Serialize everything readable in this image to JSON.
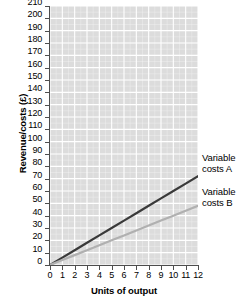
{
  "chart_data": {
    "type": "line",
    "title": "",
    "xlabel": "Units of output",
    "ylabel": "Revenue/costs (£)",
    "xlim": [
      0,
      12
    ],
    "ylim": [
      0,
      210
    ],
    "grid": true,
    "grid_minor": true,
    "legend_position": "inline-right",
    "x_ticks": [
      0,
      1,
      2,
      3,
      4,
      5,
      6,
      7,
      8,
      9,
      10,
      11,
      12
    ],
    "x_ticklabels": [
      "0",
      "1",
      "2",
      "3",
      "4",
      "5",
      "6",
      "7",
      "8",
      "9",
      "10",
      "11",
      "12"
    ],
    "y_ticks": [
      0,
      10,
      20,
      30,
      40,
      50,
      60,
      70,
      80,
      90,
      100,
      110,
      120,
      130,
      140,
      150,
      160,
      170,
      180,
      190,
      200,
      210
    ],
    "y_ticklabels": [
      "0",
      "10",
      "20",
      "30",
      "40",
      "50",
      "60",
      "70",
      "80",
      "90",
      "100",
      "110",
      "120",
      "130",
      "140",
      "150",
      "160",
      "170",
      "180",
      "190",
      "200",
      "210"
    ],
    "x": [
      0,
      1,
      2,
      3,
      4,
      5,
      6,
      7,
      8,
      9,
      10,
      11,
      12
    ],
    "series": [
      {
        "name": "Variable costs A",
        "label_line1": "Variable",
        "label_line2": "costs A",
        "color": "#3a3a3a",
        "linewidth": 2.2,
        "values": [
          0,
          6,
          12,
          18,
          24,
          30,
          36,
          42,
          48,
          54,
          60,
          66,
          72
        ]
      },
      {
        "name": "Variable costs B",
        "label_line1": "Variable",
        "label_line2": "costs B",
        "color": "#b0b0b0",
        "linewidth": 2.2,
        "values": [
          0,
          4,
          8,
          12,
          16,
          20,
          24,
          28,
          32,
          36,
          40,
          44,
          48
        ]
      }
    ],
    "plot_background": "#dcdcdc",
    "grid_color": "#ffffff",
    "axis_color": "#4d4d4d"
  }
}
